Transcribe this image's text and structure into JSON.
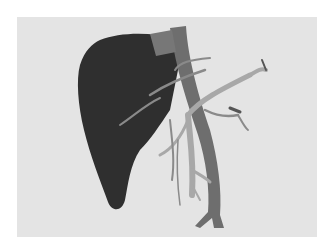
{
  "image": {
    "subject": "3D rendering of liver with hepatic vasculature",
    "background_color": "#ffffff",
    "panel_color": "#e4e4e4",
    "colors": {
      "liver": "#2f2f2f",
      "vena_cava": "#6e6e6e",
      "portal_vein": "#a8a8a8",
      "hepatic_artery": "#8a8a8a"
    }
  }
}
